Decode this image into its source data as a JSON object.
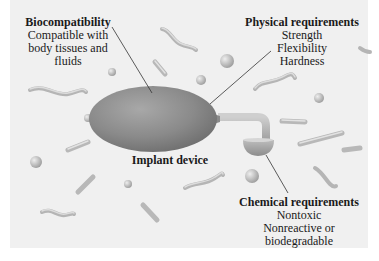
{
  "diagram": {
    "background_color": "#f0f0f0",
    "device_color": "#8e8e8e",
    "callouts": {
      "biocompatibility": {
        "title": "Biocompatibility",
        "lines": [
          "Compatible with",
          "body tissues and",
          "fluids"
        ]
      },
      "physical": {
        "title": "Physical requirements",
        "lines": [
          "Strength",
          "Flexibility",
          "Hardness"
        ]
      },
      "device": {
        "title": "Implant device"
      },
      "chemical": {
        "title": "Chemical requirements",
        "lines": [
          "Nontoxic",
          "Nonreactive or",
          "biodegradable"
        ]
      }
    }
  }
}
